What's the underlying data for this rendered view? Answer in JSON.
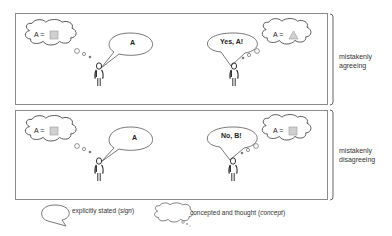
{
  "scenarios": [
    {
      "label_line1": "mistakenly",
      "label_line2": "agreeing",
      "speaker": {
        "thought_prefix": "A =",
        "thought_shape": "square",
        "utterance": "A"
      },
      "listener": {
        "utterance": "Yes, A!",
        "thought_prefix": "A =",
        "thought_shape": "triangle"
      }
    },
    {
      "label_line1": "mistakenly",
      "label_line2": "disagreeing",
      "speaker": {
        "thought_prefix": "A =",
        "thought_shape": "square",
        "utterance": "A"
      },
      "listener": {
        "utterance": "No, B!",
        "thought_prefix": "A =",
        "thought_shape": "square"
      }
    }
  ],
  "legend": {
    "speech_label": "explicitly stated (",
    "speech_term": "sign",
    "speech_close": ")",
    "thought_label": "concepted and thought (",
    "thought_term": "concept",
    "thought_close": ")"
  },
  "colors": {
    "stroke": "#555555",
    "frame": "#8a8a8a",
    "shape_fill": "#d0d0d0",
    "shape_stroke": "#999999"
  }
}
